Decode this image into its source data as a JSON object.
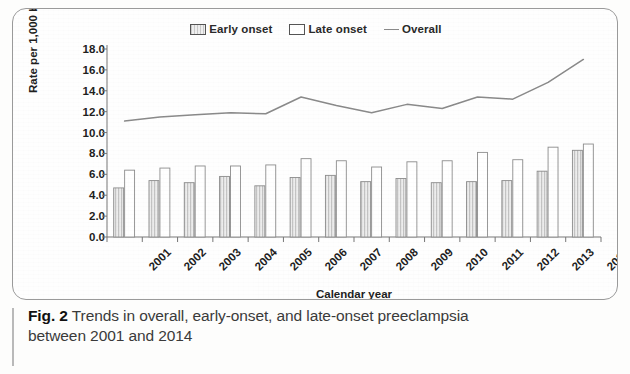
{
  "figure": {
    "caption_label": "Fig. 2",
    "caption_line1": "Trends in overall, early-onset, and late-onset preeclampsia",
    "caption_line2": "between 2001 and 2014"
  },
  "legend": {
    "items": [
      {
        "label": "Early onset",
        "marker": "hatched-square-swatch"
      },
      {
        "label": "Late onset",
        "marker": "white-square-swatch"
      },
      {
        "label": "Overall",
        "marker": "line-swatch"
      }
    ]
  },
  "axes": {
    "y_title": "Rate per 1,000 births",
    "x_title": "Calendar year",
    "y_ticks": [
      "0.0",
      "2.0",
      "4.0",
      "6.0",
      "8.0",
      "10.0",
      "12.0",
      "14.0",
      "16.0",
      "18.0"
    ]
  },
  "chart_data": {
    "type": "bar",
    "title": "Trends in overall, early-onset, and late-onset preeclampsia between 2001 and 2014",
    "xlabel": "Calendar year",
    "ylabel": "Rate per 1,000 births",
    "ylim": [
      0,
      18
    ],
    "ytick_step": 2,
    "grid": false,
    "legend_position": "top-center",
    "categories": [
      "2001",
      "2002",
      "2003",
      "2004",
      "2005",
      "2006",
      "2007",
      "2008",
      "2009",
      "2010",
      "2011",
      "2012",
      "2013",
      "2014"
    ],
    "series": [
      {
        "name": "Early onset",
        "type": "bar",
        "color": "#d9d9d9",
        "values": [
          4.7,
          5.4,
          5.2,
          5.8,
          4.9,
          5.7,
          5.9,
          5.3,
          5.6,
          5.2,
          5.3,
          5.4,
          6.3,
          8.3
        ]
      },
      {
        "name": "Late onset",
        "type": "bar",
        "color": "#ffffff",
        "values": [
          6.4,
          6.6,
          6.8,
          6.8,
          6.9,
          7.5,
          7.3,
          6.7,
          7.2,
          7.3,
          8.1,
          7.4,
          8.6,
          8.9
        ]
      },
      {
        "name": "Overall",
        "type": "line",
        "color": "#8a8a8a",
        "values": [
          11.1,
          11.5,
          11.7,
          11.9,
          11.8,
          13.4,
          12.6,
          11.9,
          12.7,
          12.3,
          13.4,
          13.2,
          14.8,
          17.0
        ]
      }
    ]
  }
}
